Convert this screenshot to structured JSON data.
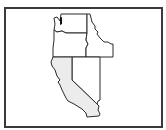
{
  "map": {
    "region": "Western United States",
    "states": [
      {
        "name": "Washington",
        "highlighted": false
      },
      {
        "name": "Oregon",
        "highlighted": false
      },
      {
        "name": "Idaho",
        "highlighted": false
      },
      {
        "name": "California",
        "highlighted": true
      },
      {
        "name": "Nevada",
        "highlighted": false
      }
    ],
    "marker": {
      "near": "Puget Sound",
      "color": "#111111"
    },
    "colors": {
      "outline": "#2b2b2b",
      "highlight_fill": "#ececec",
      "default_fill": "#ffffff",
      "frame": "#3a3a3a"
    }
  }
}
